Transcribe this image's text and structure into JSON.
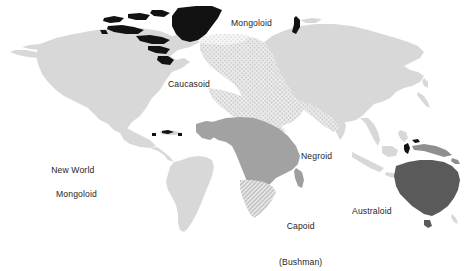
{
  "figure": {
    "type": "thematic-world-map",
    "title": "",
    "background_color": "#ffffff"
  },
  "legend_colors": {
    "base_land": "#d7d7d7",
    "caucasoid_stipple": "#e3e3e3",
    "negroid_fill": "#a0a0a0",
    "capoid_hatch": "#c6c6c6",
    "australoid_fill": "#595959",
    "arctic_mongoloid_fill": "#111111",
    "label_text": "#1e1e1e"
  },
  "labels": {
    "mongoloid": "Mongoloid",
    "caucasoid": "Caucasoid",
    "new_world_mongoloid_line1": "New World",
    "new_world_mongoloid_line2": "Mongoloid",
    "negroid": "Negroid",
    "capoid_line1": "Capoid",
    "capoid_line2": "(Bushman)",
    "australoid": "Australoid"
  },
  "regions": [
    {
      "name": "Mongoloid",
      "shading": "light-gray solid",
      "area": "Asia, Siberia, East Asia, Southeast Asia"
    },
    {
      "name": "Caucasoid",
      "shading": "fine stipple / halftone dots",
      "area": "Europe, North Africa, Middle East, South Asia"
    },
    {
      "name": "New World Mongoloid",
      "shading": "light-gray solid",
      "area": "North and South America"
    },
    {
      "name": "Negroid",
      "shading": "medium gray solid",
      "area": "Sub-Saharan Africa, Madagascar"
    },
    {
      "name": "Capoid (Bushman)",
      "shading": "diagonal hatch",
      "area": "Southern Africa"
    },
    {
      "name": "Australoid",
      "shading": "dark gray solid",
      "area": "Australia, New Guinea"
    },
    {
      "name": "Arctic (Eskimo) Mongoloid",
      "shading": "black solid",
      "area": "Greenland, Canadian Arctic archipelago, Arctic islands"
    }
  ]
}
